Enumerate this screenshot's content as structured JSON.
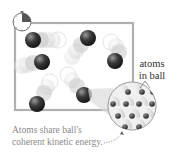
{
  "diagram": {
    "labels": {
      "atoms_in_ball_line1": "atoms",
      "atoms_in_ball_line2": "in ball",
      "caption_line1": "Atoms share ball's",
      "caption_line2": "coherent kinetic energy."
    },
    "icons": {
      "timer": "clock-icon"
    },
    "colors": {
      "box_border": "#b0b0b0",
      "ball_dark": "#2a2a2a",
      "ball_ghost": "#cccccc",
      "magnifier_fill": "#f0f0f0",
      "clock_wedge": "#555555",
      "caption_text": "#8a8a8a"
    },
    "balls": [
      {
        "x": 33,
        "y": 40,
        "trail": "right"
      },
      {
        "x": 88,
        "y": 38,
        "trail": "down-left"
      },
      {
        "x": 42,
        "y": 62,
        "trail": "left"
      },
      {
        "x": 115,
        "y": 61,
        "trail": "up-left"
      },
      {
        "x": 37,
        "y": 104,
        "trail": "up-right"
      },
      {
        "x": 84,
        "y": 95,
        "trail": "up-left"
      }
    ],
    "magnifier": {
      "cx": 132,
      "cy": 106,
      "r": 24,
      "atom_rows": 4
    }
  }
}
